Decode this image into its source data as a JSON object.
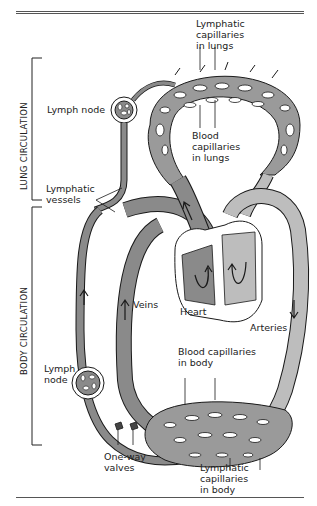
{
  "diagram": {
    "sections": {
      "lung": "LUNG CIRCULATION",
      "body": "BODY CIRCULATION"
    },
    "labels": {
      "lymphatic_capillaries_lungs": "Lymphatic\ncapillaries\nin lungs",
      "lymph_node_top": "Lymph node",
      "blood_capillaries_lungs": "Blood\ncapillaries\nin lungs",
      "lymphatic_vessels": "Lymphatic\nvessels",
      "veins": "Veins",
      "heart": "Heart",
      "arteries": "Arteries",
      "blood_capillaries_body": "Blood capillaries\nin body",
      "lymph_node_bottom": "Lymph\nnode",
      "one_way_valves": "One-way\nvalves",
      "lymphatic_capillaries_body": "Lymphatic\ncapillaries\nin body"
    },
    "colors": {
      "vessel_dark": "#8a8a8a",
      "vessel_light": "#bdbdbd",
      "outline": "#1a1a1a",
      "background": "#ffffff"
    }
  }
}
